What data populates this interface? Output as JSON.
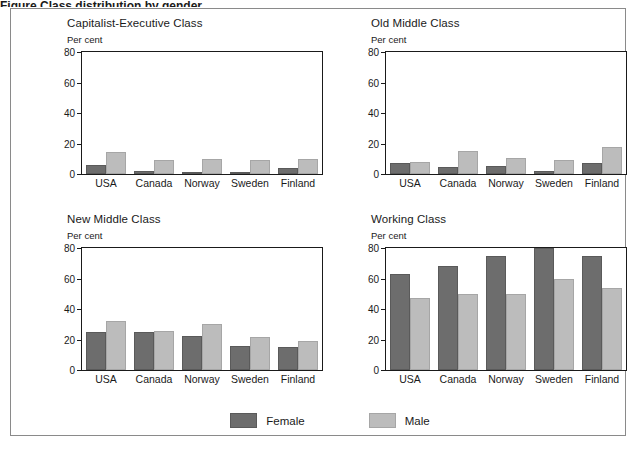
{
  "figure": {
    "caption_fragment": "Figure  Class distribution by gender",
    "frame_color": "#8a8a8a",
    "background": "#ffffff"
  },
  "legend": {
    "position": "bottom-center",
    "items": [
      {
        "label": "Female",
        "color": "#6d6d6d"
      },
      {
        "label": "Male",
        "color": "#bcbcbc"
      }
    ]
  },
  "chart_data": [
    {
      "type": "bar",
      "title": "Capitalist-Executive Class",
      "ylabel": "Per cent",
      "xlabel": "",
      "ylim": [
        0,
        80
      ],
      "yticks": [
        0,
        20,
        40,
        60,
        80
      ],
      "grid": false,
      "categories": [
        "USA",
        "Canada",
        "Norway",
        "Sweden",
        "Finland"
      ],
      "series": [
        {
          "name": "Female",
          "color": "#6d6d6d",
          "values": [
            6,
            2,
            1,
            1.5,
            4
          ]
        },
        {
          "name": "Male",
          "color": "#bcbcbc",
          "values": [
            14.5,
            9,
            10,
            9.5,
            10
          ]
        }
      ]
    },
    {
      "type": "bar",
      "title": "Old Middle Class",
      "ylabel": "Per cent",
      "xlabel": "",
      "ylim": [
        0,
        80
      ],
      "yticks": [
        0,
        20,
        40,
        60,
        80
      ],
      "grid": false,
      "categories": [
        "USA",
        "Canada",
        "Norway",
        "Sweden",
        "Finland"
      ],
      "series": [
        {
          "name": "Female",
          "color": "#6d6d6d",
          "values": [
            7.5,
            4.5,
            5,
            2,
            7
          ]
        },
        {
          "name": "Male",
          "color": "#bcbcbc",
          "values": [
            8,
            15,
            10.5,
            9,
            17.5
          ]
        }
      ]
    },
    {
      "type": "bar",
      "title": "New Middle Class",
      "ylabel": "Per cent",
      "xlabel": "",
      "ylim": [
        0,
        80
      ],
      "yticks": [
        0,
        20,
        40,
        60,
        80
      ],
      "grid": false,
      "categories": [
        "USA",
        "Canada",
        "Norway",
        "Sweden",
        "Finland"
      ],
      "series": [
        {
          "name": "Female",
          "color": "#6d6d6d",
          "values": [
            25,
            25,
            22,
            16,
            15
          ]
        },
        {
          "name": "Male",
          "color": "#bcbcbc",
          "values": [
            32,
            25.5,
            30,
            21.5,
            19
          ]
        }
      ]
    },
    {
      "type": "bar",
      "title": "Working Class",
      "ylabel": "Per cent",
      "xlabel": "",
      "ylim": [
        0,
        80
      ],
      "yticks": [
        0,
        20,
        40,
        60,
        80
      ],
      "grid": false,
      "categories": [
        "USA",
        "Canada",
        "Norway",
        "Sweden",
        "Finland"
      ],
      "series": [
        {
          "name": "Female",
          "color": "#6d6d6d",
          "values": [
            63,
            68,
            75,
            80,
            74.5
          ]
        },
        {
          "name": "Male",
          "color": "#bcbcbc",
          "values": [
            47,
            50,
            50,
            60,
            54
          ]
        }
      ]
    }
  ]
}
